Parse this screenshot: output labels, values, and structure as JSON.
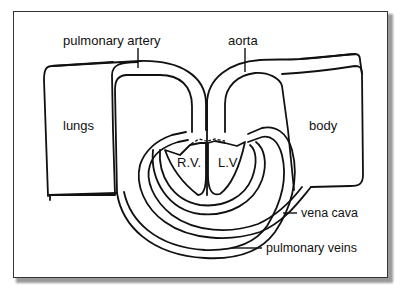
{
  "diagram": {
    "title": "",
    "labels": {
      "pulmonary_artery": "pulmonary artery",
      "aorta": "aorta",
      "lungs": "lungs",
      "body": "body",
      "right_ventricle": "R.V.",
      "left_ventricle": "L.V.",
      "vena_cava": "vena cava",
      "pulmonary_veins": "pulmonary veins"
    },
    "colors": {
      "line": "#111111",
      "background": "#ffffff",
      "frame": "#333333",
      "shadow": "#9a9a9a"
    }
  }
}
